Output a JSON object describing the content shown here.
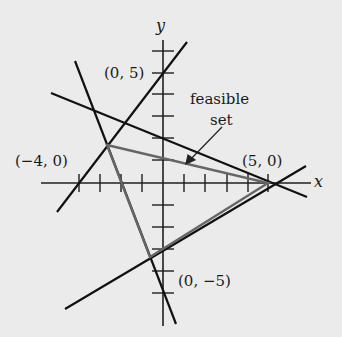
{
  "diagram": {
    "title": "",
    "axes": {
      "x_label": "x",
      "y_label": "y",
      "unit_px": 21.5,
      "origin_px": [
        163,
        183
      ]
    },
    "labels": {
      "point_0_5": "(0, 5)",
      "point_neg4_0": "(−4, 0)",
      "point_5_0": "(5, 0)",
      "point_0_neg5": "(0, −5)",
      "feasible_line1": "feasible",
      "feasible_line2": "set"
    },
    "constraint_lines": [
      {
        "name": "line-through-neg4-0-and-0-5",
        "from": [
          57,
          212
        ],
        "to": [
          187,
          42
        ]
      },
      {
        "name": "line-through-5-0-shallow-upper",
        "from": [
          51,
          93
        ],
        "to": [
          307,
          197
        ]
      },
      {
        "name": "line-steep-negative",
        "from": [
          75,
          61
        ],
        "to": [
          176,
          324
        ]
      },
      {
        "name": "line-through-5-0-lower",
        "from": [
          65,
          309
        ],
        "to": [
          306,
          166
        ]
      }
    ],
    "feasible_set_vertices_px": [
      [
        107,
        145
      ],
      [
        268,
        183
      ],
      [
        150,
        257
      ]
    ],
    "colors": {
      "background": "#ebebeb",
      "ink": "#1a1a1a",
      "feasible_edges": "#555555"
    }
  }
}
